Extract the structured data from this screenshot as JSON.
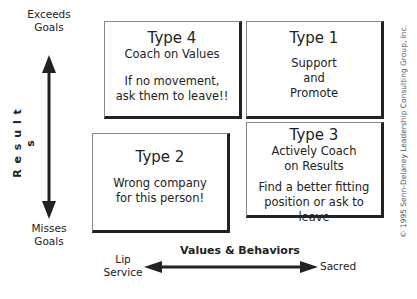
{
  "y_axis": {
    "title": "R e s u l t s",
    "top_label": [
      "Exceeds",
      "Goals"
    ],
    "bottom_label": [
      "Misses",
      "Goals"
    ]
  },
  "x_axis": {
    "title": "Values & Behaviors",
    "left_label": [
      "Lip",
      "Service"
    ],
    "right_label": "Sacred"
  },
  "quadrants": {
    "type4": {
      "title": "Type 4",
      "subtitle": "Coach on Values",
      "action": [
        "If no movement,",
        "ask them to leave!!"
      ]
    },
    "type1": {
      "title": "Type 1",
      "action": [
        "Support",
        "and",
        "Promote"
      ]
    },
    "type2": {
      "title": "Type 2",
      "action": [
        "Wrong company",
        "for this person!"
      ]
    },
    "type3": {
      "title": "Type 3",
      "subtitle": [
        "Actively Coach",
        "on Results"
      ],
      "action": [
        "Find a better fitting",
        "position or ask to leave"
      ]
    }
  },
  "copyright": "© 1995 Senn-Delaney Leadership Consulting Group, Inc.",
  "colors": {
    "arrow": "#222222",
    "box_border": "#222222",
    "background": "#ffffff"
  }
}
